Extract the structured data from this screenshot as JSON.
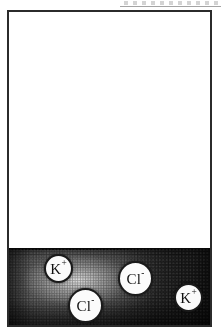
{
  "figure": {
    "width": 221,
    "height": 332
  },
  "vessel": {
    "name": "container",
    "border_color": "#2b2b2b",
    "fill_color": "#ffffff",
    "headspace_label": ""
  },
  "solution": {
    "name": "kcl-solution",
    "fill_dark": "#232323",
    "fill_light": "#4a4a4a",
    "surface_color": "#0e0e0e",
    "texture": "halftone"
  },
  "ions": [
    {
      "id": "k-left",
      "species": "K",
      "charge": "+",
      "label": "K",
      "charge_symbol": "+",
      "kind": "cation",
      "circle_color": "#fbfbfb",
      "outline_color": "#1a1a1a"
    },
    {
      "id": "cl-mid",
      "species": "Cl",
      "charge": "-",
      "label": "Cl",
      "charge_symbol": "-",
      "kind": "anion",
      "circle_color": "#fbfbfb",
      "outline_color": "#1a1a1a"
    },
    {
      "id": "cl-low",
      "species": "Cl",
      "charge": "-",
      "label": "Cl",
      "charge_symbol": "-",
      "kind": "anion",
      "circle_color": "#fbfbfb",
      "outline_color": "#1a1a1a"
    },
    {
      "id": "k-right",
      "species": "K",
      "charge": "+",
      "label": "K",
      "charge_symbol": "+",
      "kind": "cation",
      "circle_color": "#fbfbfb",
      "outline_color": "#1a1a1a"
    }
  ]
}
